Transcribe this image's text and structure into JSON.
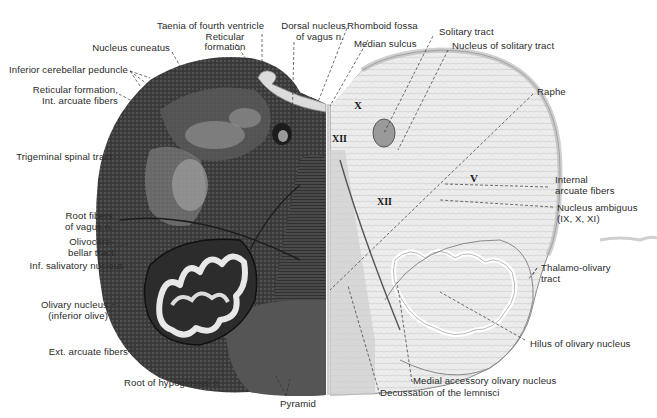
{
  "figure": {
    "left_half_style": "myelin stain (dark)",
    "right_half_style": "cell stain (light)",
    "colors": {
      "background": "#ffffff",
      "dark_tissue": "#3a3a3a",
      "mid_tissue": "#6a6a6a",
      "light_tissue": "#e6e6e6",
      "label_text": "#2a2a2a",
      "leader_line": "#333333"
    }
  },
  "labels": {
    "taenia": "Taenia of fourth ventricle",
    "reticular_formation_top_1": "Reticular",
    "reticular_formation_top_2": "formation",
    "dorsal_nucleus_vagus_1": "Dorsal nucleus",
    "dorsal_nucleus_vagus_2": "of vagus n.",
    "rhomboid_fossa": "Rhomboid fossa",
    "median_sulcus": "Median sulcus",
    "solitary_tract": "Solitary tract",
    "nucleus_solitary_tract": "Nucleus of solitary tract",
    "nucleus_cuneatus": "Nucleus cuneatus",
    "inferior_cerebellar_peduncle": "Inferior cerebellar peduncle",
    "reticular_int_arcuate_1": "Reticular formation,",
    "reticular_int_arcuate_2": "Int. arcuate fibers",
    "raphe": "Raphe",
    "trigeminal_spinal_tract": "Trigeminal spinal tract",
    "internal_arcuate_1": "Internal",
    "internal_arcuate_2": "arcuate fibers",
    "nucleus_ambiguus_1": "Nucleus ambiguus",
    "nucleus_ambiguus_2": "(IX, X, XI)",
    "root_fibers_vagus_1": "Root fibers",
    "root_fibers_vagus_2": "of vagus n.",
    "olivocerebellar_1": "Olivocere-",
    "olivocerebellar_2": "bellar tract",
    "inf_salivatory": "Inf. salivatory nucleus",
    "thalamo_olivary_1": "Thalamo-olivary",
    "thalamo_olivary_2": "tract",
    "olivary_nucleus_1": "Olivary nucleus",
    "olivary_nucleus_2": "(inferior olive)",
    "hilus": "Hilus of olivary nucleus",
    "ext_arcuate": "Ext. arcuate fibers",
    "root_hypoglossal": "Root of hypoglossal n.",
    "medial_accessory_olivary": "Medial accessory olivary nucleus",
    "pyramid": "Pyramid",
    "decussation_lemnisci": "Decussation of the lemnisci"
  },
  "nerve_markers": {
    "x_top": "X",
    "xii_center": "XII",
    "xii_right": "XII",
    "v_right": "V"
  }
}
